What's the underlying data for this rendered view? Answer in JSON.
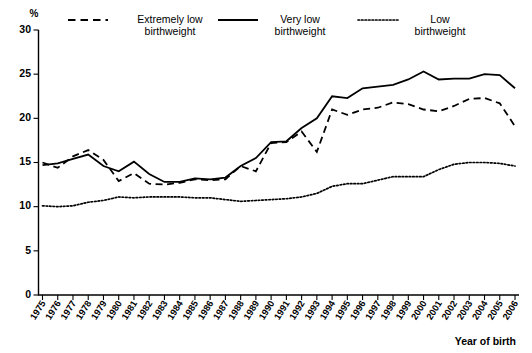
{
  "chart_data": {
    "type": "line",
    "title": "",
    "xlabel": "Year of birth",
    "ylabel": "%",
    "ylim": [
      0,
      30
    ],
    "yticks": [
      0,
      5,
      10,
      15,
      20,
      25,
      30
    ],
    "grid": false,
    "legend_position": "top",
    "categories": [
      "1975",
      "1976",
      "1977",
      "1978",
      "1979",
      "1980",
      "1981",
      "1982",
      "1983",
      "1984",
      "1985",
      "1986",
      "1987",
      "1988",
      "1989",
      "1990",
      "1991",
      "1992",
      "1993",
      "1994",
      "1995",
      "1996",
      "1997",
      "1998",
      "1999",
      "2000",
      "2001",
      "2002",
      "2003",
      "2004",
      "2005",
      "2006"
    ],
    "series": [
      {
        "name": "Extremely low birthweight",
        "style": "dashed",
        "values": [
          15.0,
          14.4,
          15.7,
          16.4,
          15.3,
          12.9,
          13.8,
          12.6,
          12.5,
          12.7,
          13.1,
          13.0,
          13.1,
          14.6,
          14.0,
          17.2,
          17.3,
          18.5,
          16.2,
          21.0,
          20.4,
          21.0,
          21.2,
          21.8,
          21.6,
          21.0,
          20.8,
          21.4,
          22.2,
          22.3,
          21.7,
          19.1
        ]
      },
      {
        "name": "Very low birthweight",
        "style": "solid",
        "values": [
          14.7,
          14.9,
          15.4,
          15.9,
          14.6,
          14.0,
          15.1,
          13.7,
          12.8,
          12.8,
          13.2,
          13.1,
          13.3,
          14.6,
          15.5,
          17.3,
          17.4,
          18.9,
          20.0,
          22.5,
          22.3,
          23.4,
          23.6,
          23.8,
          24.4,
          25.3,
          24.4,
          24.5,
          24.5,
          25.0,
          24.9,
          23.4
        ]
      },
      {
        "name": "Low birthweight",
        "style": "dotted",
        "values": [
          10.1,
          10.0,
          10.1,
          10.5,
          10.7,
          11.1,
          11.0,
          11.1,
          11.1,
          11.1,
          11.0,
          11.0,
          10.8,
          10.6,
          10.7,
          10.8,
          10.9,
          11.1,
          11.5,
          12.3,
          12.6,
          12.6,
          13.0,
          13.4,
          13.4,
          13.4,
          14.2,
          14.8,
          15.0,
          15.0,
          14.9,
          14.6
        ]
      }
    ]
  },
  "legend": {
    "items": [
      {
        "label_line1": "Extremely low",
        "label_line2": "birthweight",
        "style": "dashed"
      },
      {
        "label_line1": "Very low",
        "label_line2": "birthweight",
        "style": "solid"
      },
      {
        "label_line1": "Low",
        "label_line2": "birthweight",
        "style": "dotted"
      }
    ]
  },
  "axis": {
    "y_unit": "%",
    "x_title": "Year of birth"
  }
}
